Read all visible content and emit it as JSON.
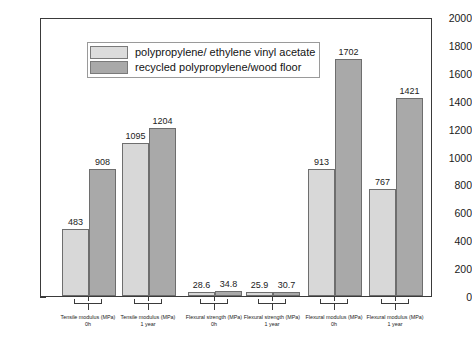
{
  "chart_data": {
    "type": "bar",
    "title": "",
    "xlabel": "",
    "ylabel": "",
    "ylim": [
      0,
      2000
    ],
    "ytick_step": 200,
    "yticks": [
      0,
      200,
      400,
      600,
      800,
      1000,
      1200,
      1400,
      1600,
      1800,
      2000
    ],
    "minor_tick_step": 100,
    "grid": false,
    "legend_position": "top-left-inside",
    "categories": [
      "Tensile modulus (MPa) 0h",
      "Tensile modulus (MPa) 1 year",
      "Flexural strength (MPa) 0h",
      "Flexural strength (MPa) 1 year",
      "Flexural modulus (MPa) 0h",
      "Flexural modulus (MPa) 1 year"
    ],
    "category_lines": [
      {
        "line1": "Tensile modulus (MPa)",
        "line2": "0h"
      },
      {
        "line1": "Tensile modulus (MPa)",
        "line2": "1 year"
      },
      {
        "line1": "Flexural strength (MPa)",
        "line2": "0h"
      },
      {
        "line1": "Flexural strength (MPa)",
        "line2": "1 year"
      },
      {
        "line1": "Flexural modulus (MPa)",
        "line2": "0h"
      },
      {
        "line1": "Flexural modulus (MPa)",
        "line2": "1 year"
      }
    ],
    "series": [
      {
        "name": "polypropylene/ ethylene vinyl acetate",
        "color": "#d8d8d8",
        "values": [
          483,
          1095,
          28.6,
          25.9,
          913,
          767
        ],
        "labels": [
          "483",
          "1095",
          "28.6",
          "25.9",
          "913",
          "767"
        ]
      },
      {
        "name": "recycled polypropylene/wood floor",
        "color": "#a9a9a9",
        "values": [
          908,
          1204,
          34.8,
          30.7,
          1702,
          1421
        ],
        "labels": [
          "908",
          "1204",
          "34.8",
          "30.7",
          "1702",
          "1421"
        ]
      }
    ]
  },
  "legend": {
    "items": [
      {
        "label": "polypropylene/ ethylene vinyl acetate",
        "swatch": "light"
      },
      {
        "label": "recycled polypropylene/wood floor",
        "swatch": "dark"
      }
    ]
  },
  "colors": {
    "series_light": "#d8d8d8",
    "series_dark": "#a9a9a9",
    "axis": "#3a3a3a",
    "background": "#ffffff",
    "text": "#1a1a1a"
  }
}
